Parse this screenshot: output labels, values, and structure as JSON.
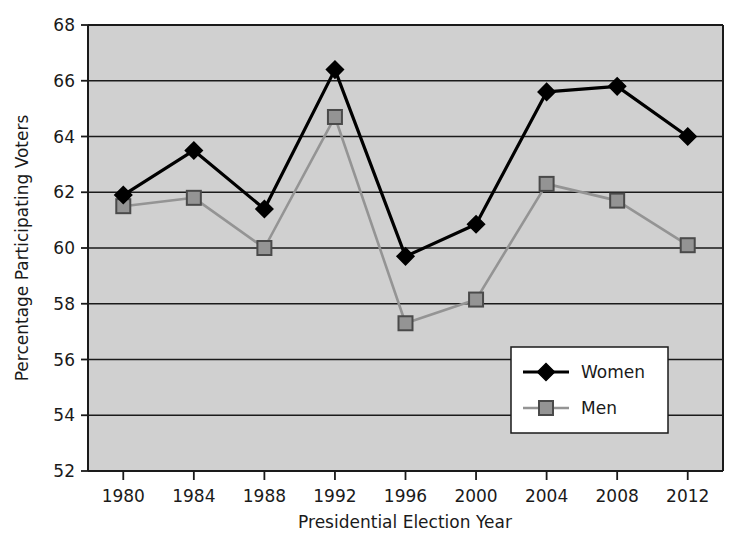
{
  "chart_data": {
    "type": "line",
    "title": "",
    "xlabel": "Presidential Election Year",
    "ylabel": "Percentage Participating Voters",
    "categories": [
      "1980",
      "1984",
      "1988",
      "1992",
      "1996",
      "2000",
      "2004",
      "2008",
      "2012"
    ],
    "x_tick_labels": [
      "1980",
      "1984",
      "1988",
      "1992",
      "1996",
      "2000",
      "2004",
      "2008",
      "2012"
    ],
    "y_tick_labels": [
      "52",
      "54",
      "56",
      "58",
      "60",
      "62",
      "64",
      "66",
      "68"
    ],
    "y_ticks": [
      52,
      54,
      56,
      58,
      60,
      62,
      64,
      66,
      68
    ],
    "ylim": [
      52,
      68
    ],
    "grid": "horizontal",
    "legend_position": "inside-lower-right",
    "plot_background": "#d0d0d0",
    "series": [
      {
        "name": "Women",
        "color": "#000000",
        "marker": "diamond",
        "values": [
          61.9,
          63.5,
          61.4,
          66.4,
          59.7,
          60.85,
          65.6,
          65.8,
          64.0
        ]
      },
      {
        "name": "Men",
        "color": "#949494",
        "marker": "square",
        "values": [
          61.5,
          61.8,
          60.0,
          64.7,
          57.3,
          58.15,
          62.3,
          61.7,
          60.1
        ]
      }
    ]
  },
  "legend": {
    "items": [
      {
        "label": "Women"
      },
      {
        "label": "Men"
      }
    ]
  },
  "axes": {
    "x_title": "Presidential Election Year",
    "y_title": "Percentage Participating Voters"
  }
}
